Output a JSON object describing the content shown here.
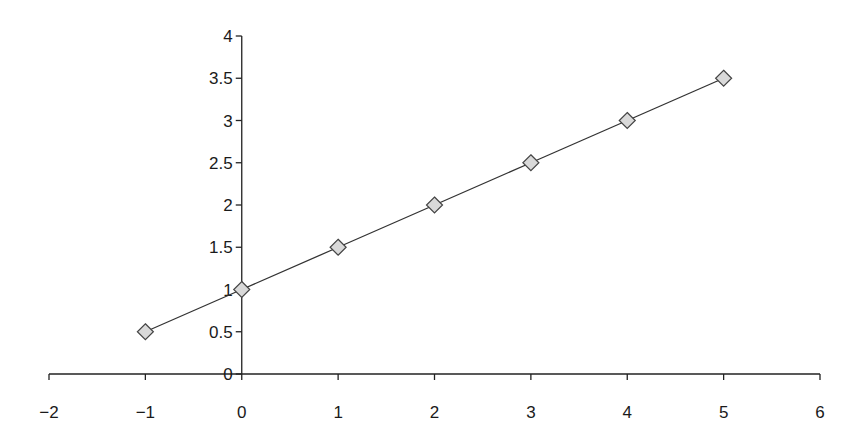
{
  "chart_data": {
    "type": "line",
    "title": "",
    "xlabel": "",
    "ylabel": "",
    "x": [
      -1,
      0,
      1,
      2,
      3,
      4,
      5
    ],
    "series": [
      {
        "name": "y = 0.5x + 1",
        "values": [
          0.5,
          1,
          1.5,
          2,
          2.5,
          3,
          3.5
        ],
        "marker": "diamond",
        "marker_fill": "#d9d9d9",
        "line_color": "#333333"
      }
    ],
    "xlim": [
      -2,
      6
    ],
    "ylim": [
      0,
      4
    ],
    "x_ticks": [
      "-2",
      "-1",
      "0",
      "1",
      "2",
      "3",
      "4",
      "5",
      "6"
    ],
    "y_ticks": [
      "0",
      "0.5",
      "1",
      "1.5",
      "2",
      "2.5",
      "3",
      "3.5",
      "4"
    ],
    "grid": false,
    "legend": null
  }
}
